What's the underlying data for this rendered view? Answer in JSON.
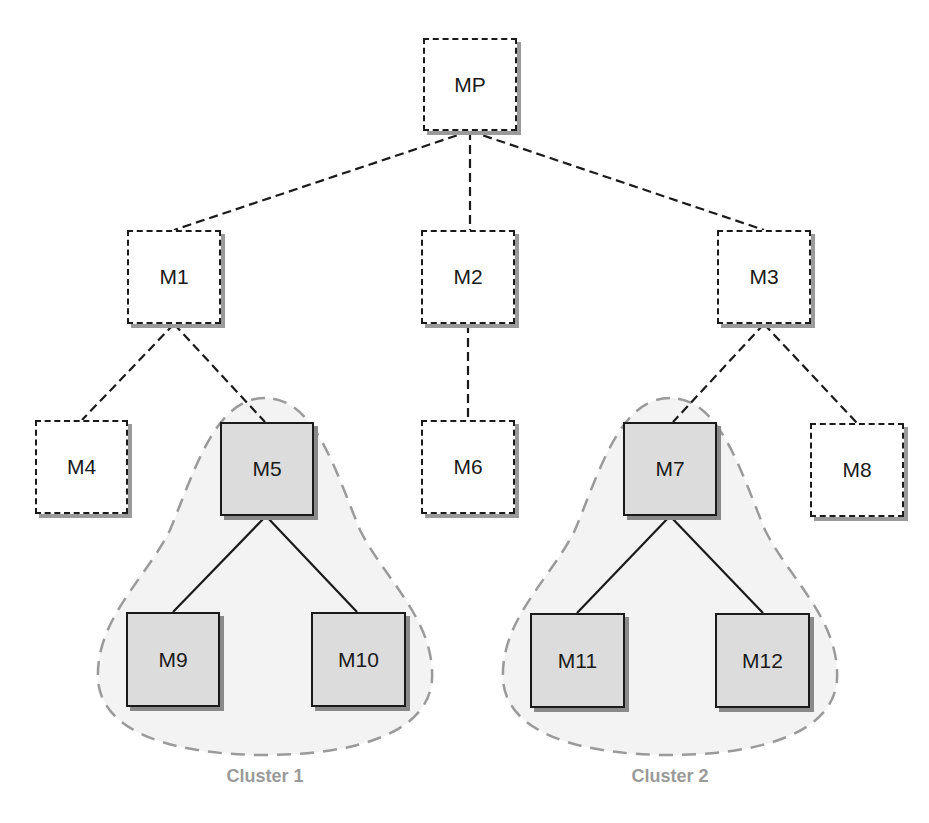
{
  "diagram": {
    "nodes": [
      {
        "id": "MP",
        "label": "MP",
        "style": "dashed"
      },
      {
        "id": "M1",
        "label": "M1",
        "style": "dashed"
      },
      {
        "id": "M2",
        "label": "M2",
        "style": "dashed"
      },
      {
        "id": "M3",
        "label": "M3",
        "style": "dashed"
      },
      {
        "id": "M4",
        "label": "M4",
        "style": "dashed"
      },
      {
        "id": "M5",
        "label": "M5",
        "style": "solid"
      },
      {
        "id": "M6",
        "label": "M6",
        "style": "dashed"
      },
      {
        "id": "M7",
        "label": "M7",
        "style": "solid"
      },
      {
        "id": "M8",
        "label": "M8",
        "style": "dashed"
      },
      {
        "id": "M9",
        "label": "M9",
        "style": "solid"
      },
      {
        "id": "M10",
        "label": "M10",
        "style": "solid"
      },
      {
        "id": "M11",
        "label": "M11",
        "style": "solid"
      },
      {
        "id": "M12",
        "label": "M12",
        "style": "solid"
      }
    ],
    "edges": [
      {
        "from": "MP",
        "to": "M1",
        "style": "dashed"
      },
      {
        "from": "MP",
        "to": "M2",
        "style": "dashed"
      },
      {
        "from": "MP",
        "to": "M3",
        "style": "dashed"
      },
      {
        "from": "M1",
        "to": "M4",
        "style": "dashed"
      },
      {
        "from": "M1",
        "to": "M5",
        "style": "dashed"
      },
      {
        "from": "M2",
        "to": "M6",
        "style": "dashed"
      },
      {
        "from": "M3",
        "to": "M7",
        "style": "dashed"
      },
      {
        "from": "M3",
        "to": "M8",
        "style": "dashed"
      },
      {
        "from": "M5",
        "to": "M9",
        "style": "solid"
      },
      {
        "from": "M5",
        "to": "M10",
        "style": "solid"
      },
      {
        "from": "M7",
        "to": "M11",
        "style": "solid"
      },
      {
        "from": "M7",
        "to": "M12",
        "style": "solid"
      }
    ],
    "clusters": [
      {
        "label": "Cluster 1",
        "members": [
          "M5",
          "M9",
          "M10"
        ]
      },
      {
        "label": "Cluster 2",
        "members": [
          "M7",
          "M11",
          "M12"
        ]
      }
    ],
    "colors": {
      "line": "#1a1a1a",
      "shaded_fill": "#dcdcdc",
      "cluster_fill": "#f3f3f3",
      "cluster_border": "#9a9a9a",
      "cluster_label": "#9a9a9a"
    }
  }
}
